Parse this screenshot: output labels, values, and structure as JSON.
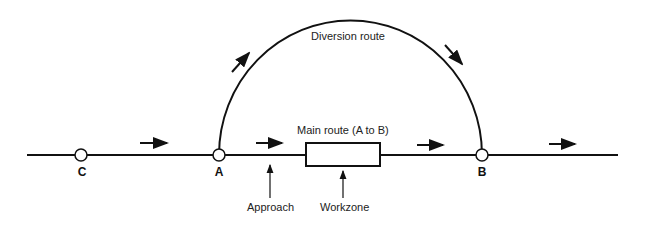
{
  "diagram": {
    "labels": {
      "diversion": "Diversion route",
      "main": "Main route (A to B)",
      "approach": "Approach",
      "workzone": "Workzone"
    },
    "nodes": [
      {
        "id": "C",
        "label": "C",
        "x": 81
      },
      {
        "id": "A",
        "label": "A",
        "x": 219
      },
      {
        "id": "B",
        "label": "B",
        "x": 482
      }
    ],
    "colors": {
      "line": "#111111",
      "background": "#ffffff"
    }
  }
}
